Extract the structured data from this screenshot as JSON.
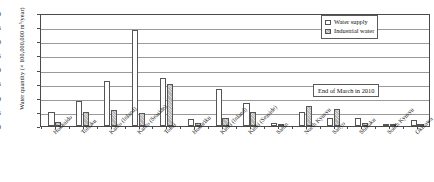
{
  "chart_data": {
    "type": "bar",
    "title": "",
    "xlabel": "",
    "ylabel": "Water quantity (× 100,000,000 m³/year)",
    "ylim": [
      0,
      40
    ],
    "yticks": [
      0,
      5,
      10,
      15,
      20,
      25,
      30,
      35,
      40
    ],
    "grid": true,
    "legend_position": "top-right",
    "annotation": "End of March in 2010",
    "categories": [
      "Hokkaido",
      "Tohoku",
      "Kanto (Inland)",
      "Kanto (Seaside)",
      "Tokai",
      "Hokuriku",
      "Kinki (Inland)",
      "Kinki (Seaside)",
      "Sanin",
      "North Kyusyu",
      "Sanyo",
      "Shikoku",
      "South Kyusyu",
      "Okinawa"
    ],
    "series": [
      {
        "name": "Water supply",
        "color": "#ffffff",
        "values": [
          5.0,
          9.0,
          16.0,
          34.0,
          17.0,
          2.5,
          13.0,
          8.0,
          1.0,
          5.0,
          3.0,
          3.0,
          0.6,
          2.0
        ]
      },
      {
        "name": "Industrial water",
        "color": "#b9b9b9",
        "values": [
          1.5,
          5.0,
          5.5,
          4.5,
          15.0,
          1.0,
          3.0,
          5.0,
          0.5,
          7.0,
          6.0,
          1.0,
          0.4,
          0.3
        ]
      }
    ]
  },
  "legend": {
    "items": [
      {
        "label": "Water supply",
        "swatch": "supply"
      },
      {
        "label": "Industrial water",
        "swatch": "industrial"
      }
    ]
  },
  "axis": {
    "y_title": "Water quantity (× 100,000,000 m³/year)"
  },
  "note": {
    "text": "End of March in 2010"
  }
}
